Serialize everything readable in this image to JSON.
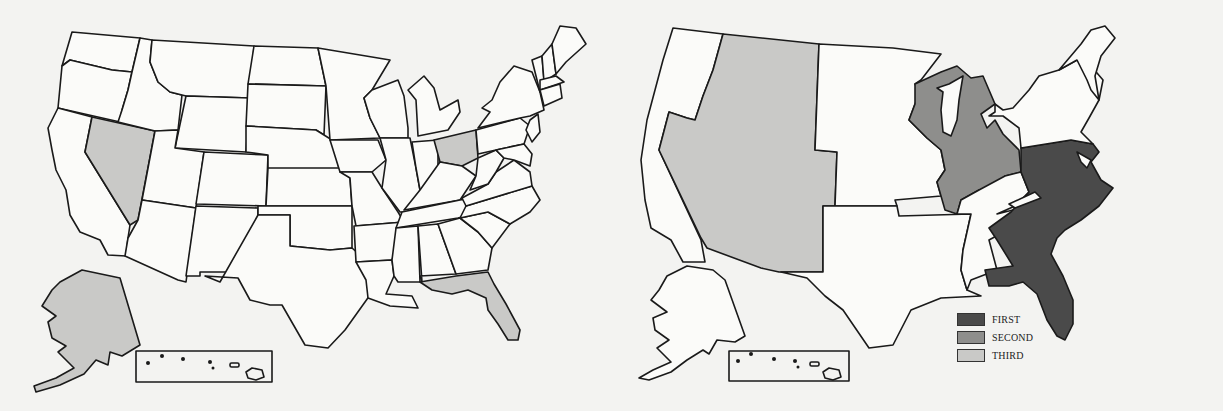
{
  "figure": {
    "panels": [
      {
        "id": "left",
        "description": "US state map with selected states shaded",
        "shaded_states": [
          "Nevada",
          "Ohio",
          "Alaska",
          "Florida"
        ],
        "shade_color": "#c9c9c7"
      },
      {
        "id": "right",
        "description": "US regional map with three shaded tiers",
        "regions": [
          {
            "label": "FIRST",
            "area": "Southeast (Atlantic coast from Pennsylvania/New Jersey to Florida)",
            "color": "#4a4a4a"
          },
          {
            "label": "SECOND",
            "area": "Great Lakes (Wisconsin, Illinois, Michigan, Indiana, Ohio)",
            "color": "#8e8e8c"
          },
          {
            "label": "THIRD",
            "area": "Mountain West (Idaho, Montana, Wyoming, Nevada, Utah, Colorado, Arizona, New Mexico)",
            "color": "#c9c9c7"
          }
        ]
      }
    ],
    "legend": {
      "items": [
        {
          "label": "FIRST",
          "color": "#4a4a4a"
        },
        {
          "label": "SECOND",
          "color": "#8e8e8c"
        },
        {
          "label": "THIRD",
          "color": "#c9c9c7"
        }
      ]
    },
    "colors": {
      "background": "#f3f3f1",
      "outline": "#1a1a1a",
      "unshaded": "#fbfbf9"
    }
  }
}
